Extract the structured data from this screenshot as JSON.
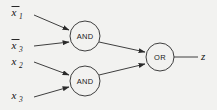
{
  "diagram": {
    "background_color": "#f2f2f0",
    "line_color": "#2a2a2a",
    "text_color": "#111111",
    "inputs": [
      {
        "id": "in1",
        "label": "x",
        "subscript": "1",
        "negated": true,
        "x": 18,
        "y": 14
      },
      {
        "id": "in2",
        "label": "x",
        "subscript": "3",
        "negated": true,
        "x": 18,
        "y": 47
      },
      {
        "id": "in3",
        "label": "x",
        "subscript": "2",
        "negated": false,
        "x": 18,
        "y": 64
      },
      {
        "id": "in4",
        "label": "x",
        "subscript": "3",
        "negated": false,
        "x": 18,
        "y": 98
      }
    ],
    "gates": [
      {
        "id": "and-top",
        "type": "AND",
        "label": "AND",
        "cx": 85,
        "cy": 36,
        "r": 15
      },
      {
        "id": "and-bottom",
        "type": "AND",
        "label": "AND",
        "cx": 85,
        "cy": 81,
        "r": 15
      },
      {
        "id": "or-gate",
        "type": "OR",
        "label": "OR",
        "cx": 160,
        "cy": 57,
        "r": 14
      }
    ],
    "output": {
      "id": "out-z",
      "label": "z",
      "x": 204,
      "y": 60
    },
    "connections": [
      {
        "from": "in1",
        "to": "and-top",
        "arrow": true
      },
      {
        "from": "in2",
        "to": "and-top",
        "arrow": true
      },
      {
        "from": "in3",
        "to": "and-bottom",
        "arrow": true
      },
      {
        "from": "in4",
        "to": "and-bottom",
        "arrow": true
      },
      {
        "from": "and-top",
        "to": "or-gate",
        "arrow": true
      },
      {
        "from": "and-bottom",
        "to": "or-gate",
        "arrow": true
      },
      {
        "from": "or-gate",
        "to": "out-z",
        "arrow": false
      }
    ]
  }
}
